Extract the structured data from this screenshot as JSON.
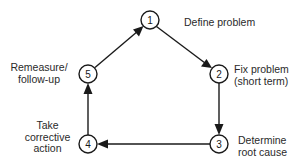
{
  "diagram": {
    "type": "cycle",
    "nodes": [
      {
        "id": "1",
        "label_lines": [
          "Define problem"
        ]
      },
      {
        "id": "2",
        "label_lines": [
          "Fix problem",
          "(short term)"
        ]
      },
      {
        "id": "3",
        "label_lines": [
          "Determine",
          "root cause"
        ]
      },
      {
        "id": "4",
        "label_lines": [
          "Take",
          "corrective",
          "action"
        ]
      },
      {
        "id": "5",
        "label_lines": [
          "Remeasure/",
          "follow-up"
        ]
      }
    ],
    "edges": [
      {
        "from": "1",
        "to": "2"
      },
      {
        "from": "2",
        "to": "3"
      },
      {
        "from": "3",
        "to": "4"
      },
      {
        "from": "4",
        "to": "5"
      },
      {
        "from": "5",
        "to": "1"
      }
    ]
  }
}
